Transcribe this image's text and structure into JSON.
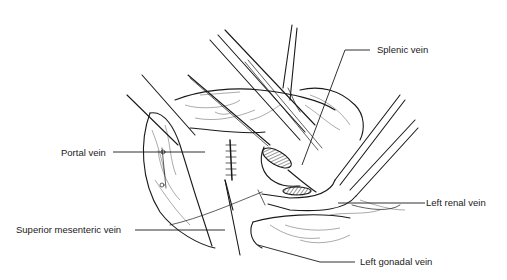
{
  "figure": {
    "type": "surgical anatomical illustration",
    "labels": [
      {
        "id": "splenic",
        "text": "Splenic vein"
      },
      {
        "id": "portal",
        "text": "Portal vein"
      },
      {
        "id": "left_renal",
        "text": "Left renal vein"
      },
      {
        "id": "sup_mesenteric",
        "text": "Superior mesenteric vein"
      },
      {
        "id": "left_gonadal",
        "text": "Left gonadal vein"
      }
    ],
    "colors": {
      "ink": "#1a1a1a",
      "background": "#ffffff"
    }
  }
}
